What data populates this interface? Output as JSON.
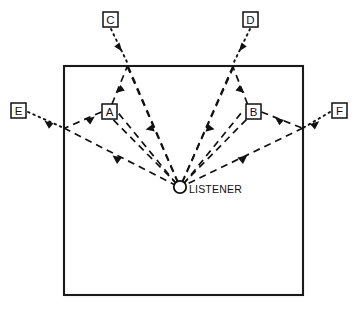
{
  "diagram": {
    "type": "acoustic-ray-reflection",
    "listener": {
      "label": "LISTENER",
      "x": 180,
      "y": 187,
      "radius": 6.2
    },
    "room": {
      "name": "room-boundary",
      "left": 64,
      "top": 66,
      "right": 303,
      "bottom": 295,
      "stroke_color": "#1a1a1a"
    },
    "colors": {
      "line": "#111111",
      "wall": "#1a1a1a",
      "background": "#ffffff"
    },
    "sources": [
      {
        "id": "C",
        "label": "C",
        "box": {
          "x": 103,
          "y": 12,
          "w": 15,
          "h": 15
        },
        "origin": {
          "x": 112,
          "y": 30
        },
        "reflection": {
          "x": 128,
          "y": 66
        },
        "position": "above-room-left",
        "incoming_style": "dotted"
      },
      {
        "id": "D",
        "label": "D",
        "box": {
          "x": 243,
          "y": 12,
          "w": 15,
          "h": 15
        },
        "origin": {
          "x": 249,
          "y": 30
        },
        "reflection": {
          "x": 233,
          "y": 66
        },
        "position": "above-room-right",
        "incoming_style": "dotted"
      },
      {
        "id": "E",
        "label": "E",
        "box": {
          "x": 11,
          "y": 103,
          "w": 15,
          "h": 15
        },
        "origin": {
          "x": 29,
          "y": 113
        },
        "reflection": {
          "x": 64,
          "y": 128
        },
        "position": "left-of-room",
        "incoming_style": "dotted"
      },
      {
        "id": "F",
        "label": "F",
        "box": {
          "x": 332,
          "y": 103,
          "w": 15,
          "h": 15
        },
        "origin": {
          "x": 329,
          "y": 113
        },
        "reflection": {
          "x": 303,
          "y": 128
        },
        "position": "right-of-room",
        "incoming_style": "dotted"
      }
    ],
    "path_labels": [
      {
        "id": "A",
        "label": "A",
        "box": {
          "x": 102,
          "y": 104,
          "w": 15,
          "h": 15
        },
        "position": "inside-room-left",
        "describes": "direct/short reflection path left"
      },
      {
        "id": "B",
        "label": "B",
        "box": {
          "x": 246,
          "y": 104,
          "w": 15,
          "h": 15
        },
        "position": "inside-room-right",
        "describes": "direct/short reflection path right"
      }
    ],
    "rays": [
      {
        "name": "ray-C-incoming",
        "from": "C",
        "to": "top-wall-left",
        "style": "dotted",
        "arrow": "mid"
      },
      {
        "name": "ray-C-reflect-to-listener",
        "from": "top-wall-left",
        "to": "listener",
        "style": "dashed",
        "arrow": "mid"
      },
      {
        "name": "ray-listener-to-top-wall-left",
        "from": "listener",
        "to": "top-wall-left",
        "style": "dashed",
        "arrow": "mid"
      },
      {
        "name": "ray-D-incoming",
        "from": "D",
        "to": "top-wall-right",
        "style": "dotted",
        "arrow": "mid"
      },
      {
        "name": "ray-D-reflect-to-listener",
        "from": "top-wall-right",
        "to": "listener",
        "style": "dashed",
        "arrow": "mid"
      },
      {
        "name": "ray-listener-to-top-wall-right",
        "from": "listener",
        "to": "top-wall-right",
        "style": "dashed",
        "arrow": "mid"
      },
      {
        "name": "ray-E-incoming",
        "from": "E",
        "to": "left-wall",
        "style": "dotted",
        "arrow": "mid"
      },
      {
        "name": "ray-E-reflect-to-listener",
        "from": "left-wall",
        "to": "listener",
        "style": "dashed",
        "arrow": "mid"
      },
      {
        "name": "ray-listener-to-left-wall",
        "from": "listener",
        "to": "left-wall",
        "style": "dashed",
        "arrow": "mid"
      },
      {
        "name": "ray-F-incoming",
        "from": "F",
        "to": "right-wall",
        "style": "dotted",
        "arrow": "mid"
      },
      {
        "name": "ray-F-reflect-to-listener",
        "from": "right-wall",
        "to": "listener",
        "style": "dashed",
        "arrow": "mid"
      },
      {
        "name": "ray-listener-to-right-wall",
        "from": "listener",
        "to": "right-wall",
        "style": "dashed",
        "arrow": "mid"
      }
    ]
  }
}
